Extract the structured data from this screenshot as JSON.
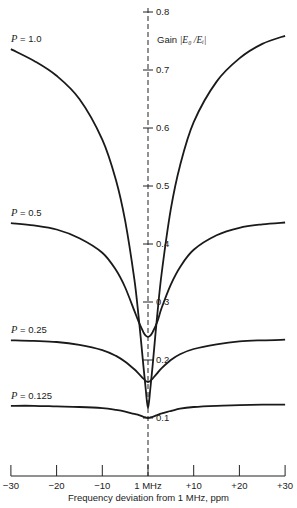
{
  "chart_data": {
    "type": "line",
    "title": "",
    "xlabel": "Frequency deviation from 1 MHz, ppm",
    "ylabel": "Gain |E0/Ei|",
    "xlim": [
      -30,
      30
    ],
    "ylim": [
      0,
      0.8
    ],
    "x_ticks": [
      -30,
      -20,
      -10,
      0,
      10,
      20,
      30
    ],
    "x_tick_labels": [
      "−30",
      "−20",
      "−10",
      "1 MHz",
      "+10",
      "+20",
      "+30"
    ],
    "y_ticks": [
      0.1,
      0.2,
      0.3,
      0.4,
      0.5,
      0.6,
      0.7,
      0.8
    ],
    "y_tick_labels": [
      "0.1",
      "0.2",
      "0.3",
      "0.4",
      "0.5",
      "0.6",
      "0.7",
      "0.8"
    ],
    "grid": false,
    "legend": "inline labels at left end of each curve",
    "center_line": "dashed vertical line at 1 MHz (0 ppm)",
    "x": [
      -30,
      -25,
      -20,
      -15,
      -10,
      -7,
      -5,
      -3,
      -2,
      -1,
      -0.5,
      0,
      0.5,
      1,
      2,
      3,
      5,
      7,
      10,
      15,
      20,
      25,
      30
    ],
    "series": [
      {
        "name": "P = 1.0",
        "label_p": "P",
        "label_val": " = 1.0",
        "values": [
          0.736,
          0.716,
          0.69,
          0.65,
          0.58,
          0.51,
          0.44,
          0.34,
          0.27,
          0.19,
          0.15,
          0.117,
          0.15,
          0.19,
          0.275,
          0.35,
          0.46,
          0.535,
          0.61,
          0.68,
          0.72,
          0.745,
          0.759
        ]
      },
      {
        "name": "P = 0.5",
        "label_p": "P",
        "label_val": " = 0.5",
        "values": [
          0.436,
          0.432,
          0.425,
          0.41,
          0.385,
          0.355,
          0.325,
          0.285,
          0.265,
          0.248,
          0.242,
          0.24,
          0.242,
          0.248,
          0.265,
          0.29,
          0.33,
          0.36,
          0.39,
          0.415,
          0.428,
          0.434,
          0.437
        ]
      },
      {
        "name": "P = 0.25",
        "label_p": "P",
        "label_val": " = 0.25",
        "values": [
          0.234,
          0.233,
          0.231,
          0.226,
          0.217,
          0.207,
          0.197,
          0.184,
          0.176,
          0.168,
          0.164,
          0.162,
          0.164,
          0.168,
          0.177,
          0.186,
          0.2,
          0.21,
          0.219,
          0.227,
          0.232,
          0.234,
          0.235
        ]
      },
      {
        "name": "P = 0.125",
        "label_p": "P",
        "label_val": " = 0.125",
        "values": [
          0.121,
          0.121,
          0.12,
          0.119,
          0.117,
          0.114,
          0.111,
          0.107,
          0.105,
          0.102,
          0.101,
          0.1,
          0.101,
          0.102,
          0.105,
          0.108,
          0.112,
          0.116,
          0.119,
          0.121,
          0.122,
          0.123,
          0.123
        ]
      }
    ],
    "colors": {
      "line": "#1a1a1a",
      "axis": "#222222",
      "background": "#ffffff"
    }
  },
  "labels": {
    "ylabel_prefix": "Gain",
    "ylabel_formula": "|E₀ /Eᵢ|",
    "xlabel": "Frequency deviation from 1 MHz, ppm"
  }
}
